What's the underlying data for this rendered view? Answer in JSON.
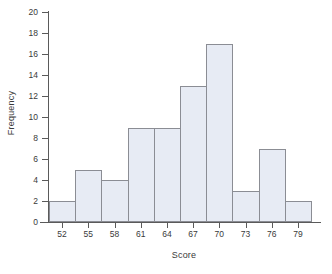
{
  "chart_data": {
    "type": "bar",
    "title": "",
    "subtitle": "",
    "xlabel": "Score",
    "ylabel": "Frequency",
    "categories": [
      "52",
      "55",
      "58",
      "61",
      "64",
      "67",
      "70",
      "73",
      "76",
      "79"
    ],
    "values": [
      2,
      5,
      4,
      9,
      9,
      13,
      17,
      3,
      7,
      2
    ],
    "ylim": [
      0,
      20
    ],
    "ytick_labels": [
      "0",
      "2",
      "4",
      "6",
      "8",
      "10",
      "12",
      "14",
      "16",
      "18",
      "20"
    ],
    "ytick_values": [
      0,
      2,
      4,
      6,
      8,
      10,
      12,
      14,
      16,
      18,
      20
    ],
    "grid": false,
    "legend": false,
    "bar_fill_color": "#e7ebf4",
    "bar_border_color": "#8b8d94",
    "axis_color": "#5a5a5a",
    "text_color": "#3a3a3a",
    "background_color": "#ffffff"
  }
}
